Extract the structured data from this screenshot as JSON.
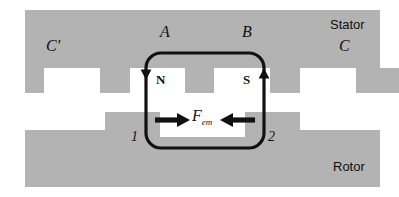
{
  "figure": {
    "width": 399,
    "height": 197,
    "colors": {
      "iron_gray": "#b3b3b3",
      "air_white": "#ffffff",
      "line_black": "#111111",
      "background": "#ffffff"
    }
  },
  "labels": {
    "stator": "Stator",
    "rotor": "Rotor",
    "phase_c_prime": "C'",
    "phase_a": "A",
    "phase_b": "B",
    "phase_c": "C",
    "pole_north": "N",
    "pole_south": "S",
    "conductor_one": "1",
    "conductor_two": "2",
    "force_symbol": "F",
    "force_subscript": "em"
  },
  "geometry": {
    "stator_label_desc": "upper toothed iron region",
    "rotor_label_desc": "lower toothed iron region",
    "flux_loop_desc": "rounded rectangular flux path linking conductors 1 and 2",
    "flux_arrow_left_direction": "down",
    "flux_arrow_right_direction": "up",
    "force_arrow_left_direction": "right",
    "force_arrow_right_direction": "left"
  }
}
